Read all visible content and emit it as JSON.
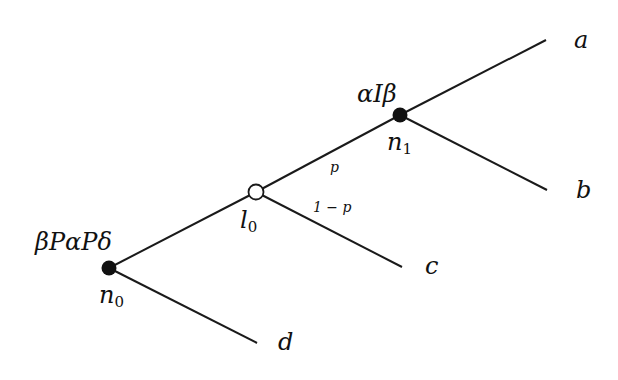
{
  "diagram": {
    "type": "game-tree",
    "nodes": {
      "n0": {
        "label": "n",
        "sub": "0",
        "annotation": "βPαPδ",
        "kind": "decision"
      },
      "l0": {
        "label": "l",
        "sub": "0",
        "kind": "chance"
      },
      "n1": {
        "label": "n",
        "sub": "1",
        "annotation": "αIβ",
        "kind": "decision"
      }
    },
    "leaves": {
      "a": "a",
      "b": "b",
      "c": "c",
      "d": "d"
    },
    "edges": {
      "l0_n1_prob": "p",
      "l0_c_prob": "1 − p"
    },
    "colors": {
      "line": "#1a1a1a",
      "decision_fill": "#111111",
      "chance_fill": "#ffffff"
    }
  }
}
